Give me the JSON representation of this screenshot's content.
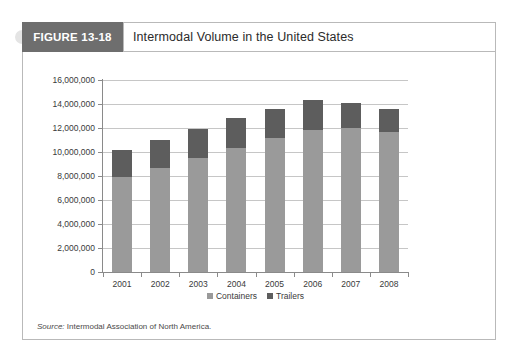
{
  "figure": {
    "tab_label": "FIGURE 13-18",
    "title": "Intermodal Volume in the United States",
    "source_label": "Source:",
    "source_text": " Intermodal Association of North America."
  },
  "colors": {
    "tab_background": "#6e6e6e",
    "containers": "#9a9a9a",
    "trailers": "#5d5d5d",
    "gridline": "#c6c6c6",
    "axis": "#8a8a8a",
    "frame": "#b9b9b9"
  },
  "chart_data": {
    "type": "bar",
    "subtype": "stacked-column",
    "title": "Intermodal Volume in the United States",
    "xlabel": "",
    "ylabel": "",
    "ylim": [
      0,
      16000000
    ],
    "ytick_interval": 2000000,
    "grid": true,
    "legend_position": "bottom-center",
    "categories": [
      "2001",
      "2002",
      "2003",
      "2004",
      "2005",
      "2006",
      "2007",
      "2008"
    ],
    "ytick_labels": [
      "16,000,000",
      "14,000,000",
      "12,000,000",
      "10,000,000",
      "8,000,000",
      "6,000,000",
      "4,000,000",
      "2,000,000",
      "0"
    ],
    "ytick_values": [
      16000000,
      14000000,
      12000000,
      10000000,
      8000000,
      6000000,
      4000000,
      2000000,
      0
    ],
    "series": [
      {
        "name": "Containers",
        "color": "#9a9a9a",
        "values": [
          7900000,
          8700000,
          9500000,
          10300000,
          11200000,
          11800000,
          12000000,
          11700000
        ]
      },
      {
        "name": "Trailers",
        "color": "#5d5d5d",
        "values": [
          2300000,
          2300000,
          2400000,
          2500000,
          2400000,
          2500000,
          2100000,
          1900000
        ]
      }
    ],
    "totals": [
      10200000,
      11000000,
      11900000,
      12800000,
      13600000,
      14300000,
      14100000,
      13600000
    ],
    "legend": [
      "Containers",
      "Trailers"
    ]
  }
}
